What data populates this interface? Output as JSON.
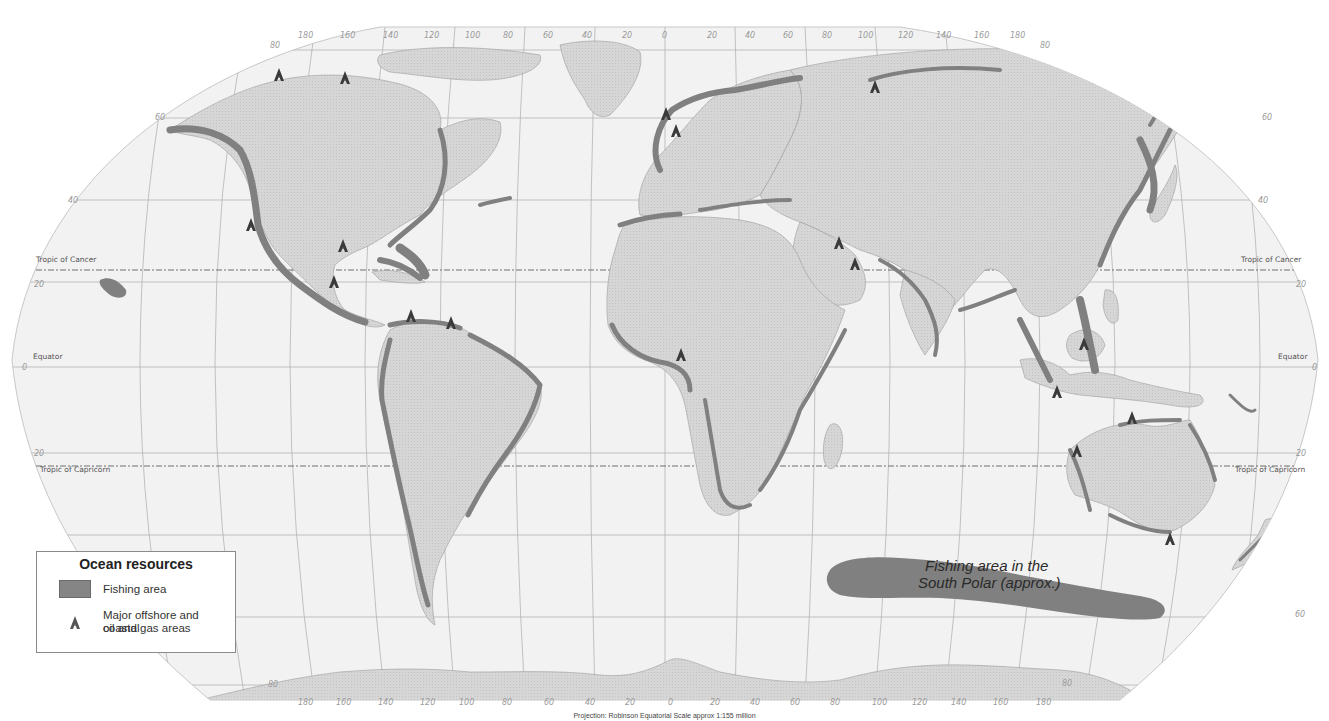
{
  "map": {
    "projection": "Robinson",
    "caption": "Projection: Robinson    Equatorial Scale approx 1:155 million",
    "colors": {
      "ocean": "#f2f2f2",
      "land": "#d3d3d3",
      "fishing_area": "#808080",
      "graticule": "#b4b4b4",
      "rig_marker": "#3a3a3a"
    },
    "lines": {
      "tropic_of_cancer_left": "Tropic of Cancer",
      "tropic_of_cancer_right": "Tropic of Cancer",
      "equator_left": "Equator",
      "equator_right": "Equator",
      "tropic_of_capricorn_left": "Tropic of Capricorn",
      "tropic_of_capricorn_right": "Tropic of Capricorn"
    },
    "latitude_ticks": {
      "n80": "80",
      "n60": "60",
      "n40": "40",
      "n20": "20",
      "eq": "0",
      "s20": "20",
      "s40": "40",
      "s60": "60",
      "s80": "80"
    },
    "longitude_ticks_top": [
      "180",
      "160",
      "140",
      "120",
      "100",
      "80",
      "60",
      "40",
      "20",
      "0",
      "20",
      "40",
      "60",
      "80",
      "100",
      "120",
      "140",
      "160",
      "180"
    ],
    "longitude_ticks_bottom": [
      "180",
      "160",
      "140",
      "120",
      "100",
      "80",
      "60",
      "40",
      "20",
      "0",
      "20",
      "40",
      "60",
      "80",
      "100",
      "120",
      "140",
      "160",
      "180"
    ],
    "annotations": {
      "south_polar_line1": "Fishing area in the",
      "south_polar_line2": "South Polar (approx.)"
    }
  },
  "legend": {
    "title": "Ocean resources",
    "items": [
      {
        "label": "Fishing area",
        "symbol": "gray-swatch"
      },
      {
        "label_line1": "Major offshore and coastal",
        "label_line2": "oil and gas areas",
        "symbol": "oil-rig-icon"
      }
    ]
  },
  "oil_gas_sites": [
    {
      "name": "Beaufort Sea",
      "x": 279,
      "y": 75
    },
    {
      "name": "Arctic Canada",
      "x": 345,
      "y": 78
    },
    {
      "name": "California",
      "x": 251,
      "y": 225
    },
    {
      "name": "Gulf of Mexico",
      "x": 343,
      "y": 246
    },
    {
      "name": "Bay of Campeche",
      "x": 334,
      "y": 282
    },
    {
      "name": "Lake Maracaibo",
      "x": 411,
      "y": 316
    },
    {
      "name": "Trinidad",
      "x": 451,
      "y": 323
    },
    {
      "name": "North Sea (north)",
      "x": 666,
      "y": 114
    },
    {
      "name": "North Sea (south)",
      "x": 676,
      "y": 131
    },
    {
      "name": "Barents / Kara Sea",
      "x": 875,
      "y": 87
    },
    {
      "name": "Persian Gulf (north)",
      "x": 839,
      "y": 243
    },
    {
      "name": "Persian Gulf (south)",
      "x": 855,
      "y": 264
    },
    {
      "name": "Gulf of Guinea",
      "x": 681,
      "y": 355
    },
    {
      "name": "Borneo",
      "x": 1084,
      "y": 344
    },
    {
      "name": "Java Sea",
      "x": 1057,
      "y": 392
    },
    {
      "name": "Timor Sea",
      "x": 1132,
      "y": 418
    },
    {
      "name": "NW Shelf Australia",
      "x": 1077,
      "y": 451
    },
    {
      "name": "Bass Strait",
      "x": 1170,
      "y": 539
    }
  ]
}
